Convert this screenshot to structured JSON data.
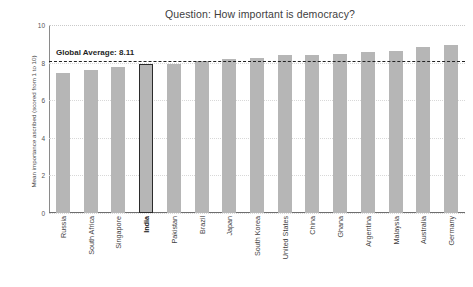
{
  "chart_data": {
    "type": "bar",
    "title": "Question: How important is democracy?",
    "xlabel": "",
    "ylabel": "Mean importance ascribed (scored from 1 to 10)",
    "ylim": [
      0,
      10
    ],
    "yticks": [
      0,
      2,
      4,
      6,
      8,
      10
    ],
    "ytick_labels": [
      "0",
      "2",
      "4",
      "6",
      "8",
      "10"
    ],
    "grid": true,
    "legend": "none",
    "categories": [
      "Russia",
      "South Africa",
      "Singapore",
      "India",
      "Pakistan",
      "Brazil",
      "Japan",
      "South Korea",
      "United States",
      "China",
      "Ghana",
      "Argentina",
      "Malaysia",
      "Australia",
      "Germany"
    ],
    "values": [
      7.45,
      7.6,
      7.75,
      7.95,
      7.95,
      8.1,
      8.2,
      8.25,
      8.4,
      8.42,
      8.45,
      8.55,
      8.6,
      8.85,
      8.95
    ],
    "highlighted_category": "India",
    "annotations": [
      {
        "name": "global-average",
        "label": "Global Average: 8.11",
        "value": 8.11,
        "style": "dashed-horizontal-line"
      }
    ],
    "colors": {
      "bar": "#b6b6b6",
      "highlight_outline": "#2b2b2b",
      "average_line": "#222222",
      "grid": "#d8d8d8",
      "axis": "#8a8a8a",
      "text": "#3c3c3c",
      "background": "#ffffff"
    }
  }
}
